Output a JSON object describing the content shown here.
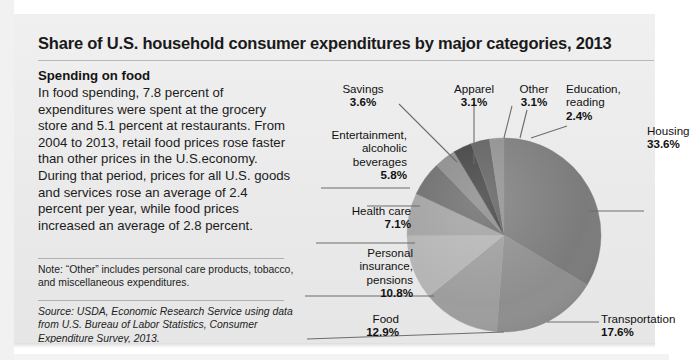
{
  "title": "Share of U.S. household consumer expenditures by major categories, 2013",
  "left_panel": {
    "subhead": "Spending on food",
    "body": "In food spending, 7.8 percent of expenditures were spent at the grocery store and 5.1 percent at restaurants.  From 2004 to 2013, retail food prices rose faster than other prices in the U.S.economy. During that period, prices for all U.S. goods and services rose an average of 2.4 percent per year, while food prices increased an average of 2.8 percent.",
    "note": "Note: “Other” includes personal care products, tobacco, and miscellaneous expenditures.",
    "source": "Source: USDA, Economic Research Service using data from U.S. Bureau of Labor Statistics, Consumer Expenditure Survey, 2013."
  },
  "chart_data": {
    "type": "pie",
    "title": "Share of U.S. household consumer expenditures by major categories, 2013",
    "legend": "none",
    "units": "percent",
    "categories": [
      "Housing",
      "Transportation",
      "Food",
      "Personal insurance, pensions",
      "Health care",
      "Entertainment, alcoholic beverages",
      "Savings",
      "Apparel",
      "Other",
      "Education, reading"
    ],
    "values": [
      33.6,
      17.6,
      12.9,
      10.8,
      7.1,
      5.8,
      3.6,
      3.1,
      3.1,
      2.4
    ],
    "labels": [
      "33.6%",
      "17.6%",
      "12.9%",
      "10.8%",
      "7.1%",
      "5.8%",
      "3.6%",
      "3.1%",
      "3.1%",
      "2.4%"
    ],
    "colors": [
      "#7b7b7b",
      "#8e8e8e",
      "#9d9d9d",
      "#b4b4b4",
      "#a1a1a1",
      "#6b6b6b",
      "#8a8a8a",
      "#3f3f3f",
      "#5e5e5e",
      "#8f8f8f"
    ],
    "start_angle_deg": 0,
    "direction": "clockwise"
  },
  "slice_labels": {
    "savings": {
      "name": "Savings",
      "pct": "3.6%"
    },
    "apparel": {
      "name": "Apparel",
      "pct": "3.1%"
    },
    "other": {
      "name": "Other",
      "pct": "3.1%"
    },
    "education_l1": "Education,",
    "education_l2": "reading",
    "education_pct": "2.4%",
    "housing": {
      "name": "Housing",
      "pct": "33.6%"
    },
    "entertainment_l1": "Entertainment,",
    "entertainment_l2": "alcoholic",
    "entertainment_l3": "beverages",
    "entertainment_pct": "5.8%",
    "health": {
      "name": "Health care",
      "pct": "7.1%"
    },
    "insurance_l1": "Personal",
    "insurance_l2": "insurance,",
    "insurance_l3": "pensions",
    "insurance_pct": "10.8%",
    "food": {
      "name": "Food",
      "pct": "12.9%"
    },
    "transportation": {
      "name": "Transportation",
      "pct": "17.6%"
    }
  },
  "ghost_text": {
    "a": "items are spending things that usually require saving.",
    "b": "ion when you save ____ percent of your",
    "c": "ause if ____ have $100 and save",
    "d": "3",
    "e": "2",
    "f": "word that"
  }
}
